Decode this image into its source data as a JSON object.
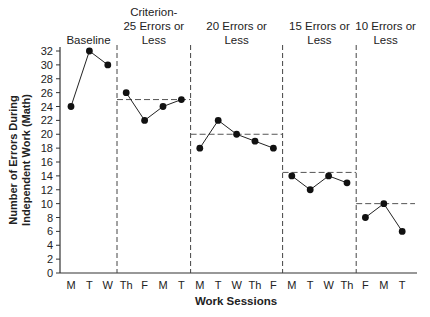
{
  "chart_data": {
    "type": "line",
    "title": "",
    "xlabel": "Work Sessions",
    "ylabel": "Number of Errors During Independent Work (Math)",
    "ylabel_lines": [
      "Number of Errors During",
      "Independent Work (Math)"
    ],
    "ylim": [
      0,
      32
    ],
    "yticks": [
      0,
      2,
      4,
      6,
      8,
      10,
      12,
      14,
      16,
      18,
      20,
      22,
      24,
      26,
      28,
      30,
      32
    ],
    "grid": false,
    "legend": null,
    "phases": [
      {
        "label_lines": [
          "Baseline"
        ],
        "criterion": null,
        "sessions": [
          "M",
          "T",
          "W"
        ],
        "values": [
          24,
          32,
          30
        ]
      },
      {
        "label_lines": [
          "Criterion-",
          "25 Errors or",
          "Less"
        ],
        "criterion": 25,
        "sessions": [
          "Th",
          "F",
          "M",
          "T"
        ],
        "values": [
          26,
          22,
          24,
          25
        ]
      },
      {
        "label_lines": [
          "20 Errors or",
          "Less"
        ],
        "criterion": 20,
        "sessions": [
          "M",
          "T",
          "W",
          "Th",
          "F"
        ],
        "values": [
          18,
          22,
          20,
          19,
          18
        ]
      },
      {
        "label_lines": [
          "15 Errors or",
          "Less"
        ],
        "criterion": 14.5,
        "sessions": [
          "M",
          "T",
          "W",
          "Th"
        ],
        "values": [
          14,
          12,
          14,
          13
        ]
      },
      {
        "label_lines": [
          "10 Errors or",
          "Less"
        ],
        "criterion": 10,
        "sessions": [
          "F",
          "M",
          "T"
        ],
        "values": [
          8,
          10,
          6
        ]
      }
    ],
    "categories": [
      "M",
      "T",
      "W",
      "Th",
      "F",
      "M",
      "T",
      "M",
      "T",
      "W",
      "Th",
      "F",
      "M",
      "T",
      "W",
      "Th",
      "F",
      "M",
      "T"
    ],
    "values": [
      24,
      32,
      30,
      26,
      22,
      24,
      25,
      18,
      22,
      20,
      19,
      18,
      14,
      12,
      14,
      13,
      8,
      10,
      6
    ]
  }
}
